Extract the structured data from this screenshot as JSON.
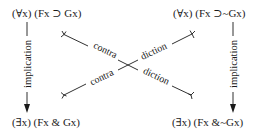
{
  "diagram": {
    "corners": {
      "top_left": "(∀x) (Fx ⊃ Gx)",
      "top_right": "(∀x) (Fx ⊃~Gx)",
      "bottom_left": "(∃x) (Fx & Gx)",
      "bottom_right": "(∃x) (Fx &~Gx)"
    },
    "edges": {
      "left_vertical": {
        "label": "implication",
        "from": "top_left",
        "to": "bottom_left",
        "arrow": "down"
      },
      "right_vertical": {
        "label": "implication",
        "from": "top_right",
        "to": "bottom_right",
        "arrow": "down"
      },
      "diagonal_a": {
        "label_part1": "contra",
        "label_part2": "diction",
        "from": "top_left",
        "to": "bottom_right"
      },
      "diagonal_b": {
        "label_part1": "contra",
        "label_part2": "diction",
        "from": "bottom_left",
        "to": "top_right"
      }
    },
    "colors": {
      "ink": "#1a1a1a",
      "background": "#ffffff"
    }
  }
}
